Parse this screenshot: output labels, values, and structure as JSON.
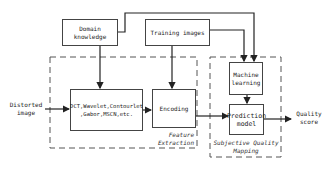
{
  "diagram": {
    "nodes": {
      "domain_knowledge": "Domain knowledge",
      "training_images": "Training images",
      "transform_methods": "DCT,Wavelet,Contourlet ,Gabor,MSCN,etc.",
      "encoding": "Encoding",
      "machine_learning": "Machine learning",
      "prediction_model": "Prediction model"
    },
    "inputs": {
      "distorted_image": "Distorted image"
    },
    "outputs": {
      "quality_score": "Quality score"
    },
    "groups": {
      "feature_extraction": "Feature Extraction",
      "subjective_quality_mapping": "Subjective Quality Mapping"
    },
    "edges": [
      {
        "from": "distorted_image",
        "to": "transform_methods"
      },
      {
        "from": "domain_knowledge",
        "to": "transform_methods"
      },
      {
        "from": "domain_knowledge",
        "to": "machine_learning"
      },
      {
        "from": "training_images",
        "to": "encoding"
      },
      {
        "from": "training_images",
        "to": "machine_learning"
      },
      {
        "from": "transform_methods",
        "to": "encoding"
      },
      {
        "from": "encoding",
        "to": "prediction_model"
      },
      {
        "from": "machine_learning",
        "to": "prediction_model"
      },
      {
        "from": "prediction_model",
        "to": "quality_score"
      }
    ]
  }
}
